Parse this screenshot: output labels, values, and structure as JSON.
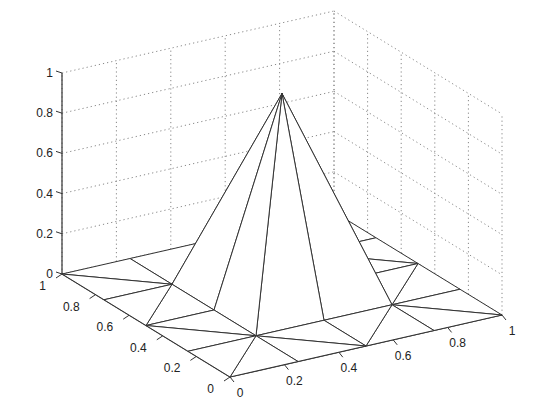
{
  "chart_data": {
    "type": "surface3d",
    "title": "",
    "xlabel": "",
    "ylabel": "",
    "zlabel": "",
    "x_ticks": [
      "0",
      "0.2",
      "0.4",
      "0.6",
      "0.8",
      "1"
    ],
    "y_ticks": [
      "0",
      "0.2",
      "0.4",
      "0.6",
      "0.8",
      "1"
    ],
    "z_ticks": [
      "0",
      "0.2",
      "0.4",
      "0.6",
      "0.8",
      "1"
    ],
    "xlim": [
      0,
      1
    ],
    "ylim": [
      0,
      1
    ],
    "zlim": [
      0,
      1
    ],
    "grid": true,
    "mesh_nodes_step": 0.25,
    "peak": {
      "x": 0.5,
      "y": 0.5,
      "z": 1
    }
  },
  "colors": {
    "mesh": "#333333",
    "grid": "#888888",
    "axis": "#333333"
  }
}
